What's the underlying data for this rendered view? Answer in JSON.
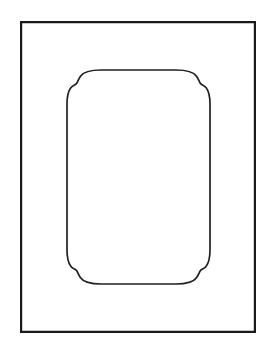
{
  "document": {
    "title": "Ornamental Rectangular Frame",
    "kind": "line-art-illustration",
    "style": "black-and-white engraving / clip art",
    "background_color": "#ffffff",
    "canvas": {
      "width": 270,
      "height": 353
    }
  },
  "artwork": {
    "name": "decorative-frame",
    "description": "A plain rectangular outer border enclosing an upright panel whose four corners are cut with ogee (S-curve) profiles.",
    "element_count": 2
  },
  "outer_border": {
    "name": "outer-rectangle",
    "shape": "rectangle",
    "stroke_color": "#1a1a1a",
    "stroke_width": 2.2,
    "fill": "none",
    "x": 20,
    "y": 21,
    "width": 236,
    "height": 312,
    "corner_radius": 0
  },
  "inner_panel": {
    "name": "inner-ogee-panel",
    "shape": "rounded-rectangle-with-ogee-corners",
    "stroke_color": "#231f20",
    "stroke_width": 1.7,
    "fill": "#ffffff",
    "left": 67,
    "top": 70,
    "right": 210,
    "bottom": 284,
    "width": 143,
    "height": 214,
    "corner_profile": "ogee",
    "corner_span": 34,
    "notch_depth": 3
  },
  "geometry": {
    "inner_path": "M 101 70 L 176 70 C 188 70 193.5 71.8 196.5 76.2 C 199.1 80 199.4 82.4 200.6 83.6 C 201.9 84.9 204.2 85.2 206 87.5 C 208.6 90.8 210 95.6 210 104 L 210 250 C 210 258.4 208.6 263.2 206 266.5 C 204.2 268.8 201.9 269.1 200.6 270.4 C 199.4 271.6 199.1 274 196.5 277.8 C 193.5 282.2 188 284 176 284 L 101 284 C 89 284 83.5 282.2 80.5 277.8 C 77.9 274 77.6 271.6 76.4 270.4 C 75.1 269.1 72.8 268.8 71 266.5 C 68.4 263.2 67 258.4 67 250 L 67 104 C 67 95.6 68.4 90.8 71 87.5 C 72.8 85.2 75.1 84.9 76.4 83.6 C 77.6 82.4 77.9 80 80.5 76.2 C 83.5 71.8 89 70 101 70 Z",
    "outer_path": "M 21.1 22.1 L 254.9 22.1 L 254.9 331.9 L 21.1 331.9 Z"
  },
  "palette": {
    "ink": "#1a1a1a",
    "ink_soft": "#231f20",
    "paper": "#ffffff"
  }
}
